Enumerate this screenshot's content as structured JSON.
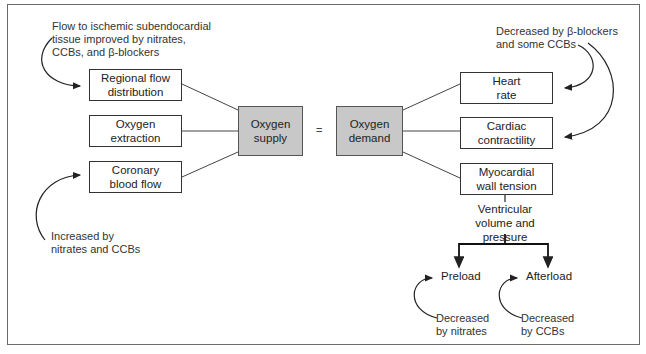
{
  "diagram": {
    "supply_factors": [
      {
        "label": "Regional flow\ndistribution"
      },
      {
        "label": "Oxygen\nextraction"
      },
      {
        "label": "Coronary\nblood flow"
      }
    ],
    "supply": {
      "label": "Oxygen\nsupply"
    },
    "equals": "=",
    "demand": {
      "label": "Oxygen\ndemand"
    },
    "demand_factors": [
      {
        "label": "Heart\nrate"
      },
      {
        "label": "Cardiac\ncontractility"
      },
      {
        "label": "Myocardial\nwall tension"
      }
    ],
    "ventricular": "Ventricular\nvolume and\npressure",
    "preload": "Preload",
    "afterload": "Afterload",
    "annotations": {
      "flow_note": "Flow to ischemic subendocardial\ntissue improved by nitrates,\nCCBs, and β-blockers",
      "coronary_note": "Increased by\nnitrates and CCBs",
      "hr_contract_note": "Decreased by β-blockers\nand some CCBs",
      "preload_note": "Decreased\nby nitrates",
      "afterload_note": "Decreased\nby CCBs"
    }
  }
}
